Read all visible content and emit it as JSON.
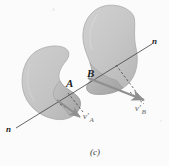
{
  "figure": {
    "caption": "(c)",
    "background_color": "#fbfbfb",
    "body_fill": "#c6c6c6",
    "body_fill_light": "#d2d2d2",
    "body_edge": "#9a9a9a",
    "arrow_color": "#8f8f8f",
    "line_color": "#4a4a4a",
    "dashed_color": "#3f3f3f",
    "labels": {
      "body_a": "A",
      "body_b": "B",
      "normal_left": "n",
      "normal_right": "n",
      "velocity_a": "v",
      "velocity_a_prime": "′",
      "velocity_a_sub": "A",
      "velocity_b": "v",
      "velocity_b_prime": "′",
      "velocity_b_sub": "B"
    }
  }
}
